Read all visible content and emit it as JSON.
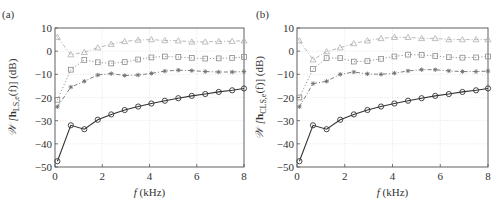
{
  "chart_data": [
    {
      "panel_label": "(a)",
      "type": "line",
      "title": "",
      "xlabel": "f (kHz)",
      "ylabel": "W [h_LS,e(f)] (dB)",
      "ylabel_parts": {
        "main": "𝒲 [",
        "bold": "h",
        "sub": "LS,e",
        "tail": "(f)] (dB)"
      },
      "xlim": [
        0,
        8
      ],
      "ylim": [
        -50,
        10
      ],
      "xticks": [
        0,
        2,
        4,
        6,
        8
      ],
      "yticks": [
        10,
        0,
        -10,
        -20,
        -30,
        -40,
        -50
      ],
      "grid": true,
      "legend": null,
      "x": [
        0.1,
        0.67,
        1.24,
        1.81,
        2.38,
        2.95,
        3.52,
        4.08,
        4.65,
        5.22,
        5.79,
        6.36,
        6.93,
        7.5,
        8.0
      ],
      "series": [
        {
          "name": "triangle",
          "marker": "triangle",
          "linestyle": "dashdot",
          "color": "#b0b0b0",
          "values": [
            6,
            -1.5,
            -0.5,
            1.5,
            3,
            4.2,
            4.8,
            5,
            4.6,
            4.5,
            4,
            4,
            4.2,
            4.3,
            4.5
          ]
        },
        {
          "name": "square",
          "marker": "square",
          "linestyle": "dotted",
          "color": "#8a8a8a",
          "values": [
            -21,
            -8,
            -3.8,
            -4.8,
            -5.3,
            -4.7,
            -3.6,
            -2.7,
            -2.3,
            -2.5,
            -2.9,
            -3.2,
            -3.1,
            -2.9,
            -2.5
          ]
        },
        {
          "name": "star",
          "marker": "star",
          "linestyle": "dashdot",
          "color": "#707070",
          "values": [
            -24,
            -15.5,
            -13,
            -10.3,
            -9.7,
            -10.5,
            -10.3,
            -9.6,
            -8.6,
            -8.2,
            -8.4,
            -8.8,
            -9,
            -9,
            -8.8
          ]
        },
        {
          "name": "circle",
          "marker": "circle",
          "linestyle": "solid",
          "color": "#333333",
          "values": [
            -47.5,
            -32,
            -33.7,
            -29.6,
            -27.3,
            -25.4,
            -23.9,
            -22.6,
            -21.4,
            -20.3,
            -19.3,
            -18.5,
            -17.6,
            -16.9,
            -16.1
          ]
        }
      ]
    },
    {
      "panel_label": "(b)",
      "type": "line",
      "title": "",
      "xlabel": "f (kHz)",
      "ylabel": "W [h_CLS,e(f)] (dB)",
      "ylabel_parts": {
        "main": "𝒲 [",
        "bold": "h",
        "sub": "CLS,e",
        "tail": "(f)] (dB)"
      },
      "xlim": [
        0,
        8
      ],
      "ylim": [
        -50,
        10
      ],
      "xticks": [
        0,
        2,
        4,
        6,
        8
      ],
      "yticks": [
        10,
        0,
        -10,
        -20,
        -30,
        -40,
        -50
      ],
      "grid": true,
      "legend": null,
      "x": [
        0.1,
        0.67,
        1.24,
        1.81,
        2.38,
        2.95,
        3.52,
        4.08,
        4.65,
        5.22,
        5.79,
        6.36,
        6.93,
        7.5,
        8.0
      ],
      "series": [
        {
          "name": "triangle",
          "marker": "triangle",
          "linestyle": "dashdot",
          "color": "#b0b0b0",
          "values": [
            4.5,
            -3.7,
            -0.2,
            1.5,
            3.3,
            4.5,
            5.5,
            6,
            6,
            5.5,
            5.5,
            5,
            5,
            5,
            5
          ]
        },
        {
          "name": "square",
          "marker": "square",
          "linestyle": "dotted",
          "color": "#8a8a8a",
          "values": [
            -20,
            -7.7,
            -3,
            -3,
            -4.5,
            -4.3,
            -3.3,
            -2.3,
            -1.5,
            -1.6,
            -2.1,
            -2.6,
            -2.8,
            -2.7,
            -2.3
          ]
        },
        {
          "name": "star",
          "marker": "star",
          "linestyle": "dashdot",
          "color": "#707070",
          "values": [
            -24,
            -14,
            -13,
            -10,
            -9,
            -9.8,
            -10,
            -9.5,
            -8.5,
            -8,
            -8,
            -8.5,
            -8.8,
            -8.8,
            -8.6
          ]
        },
        {
          "name": "circle",
          "marker": "circle",
          "linestyle": "solid",
          "color": "#333333",
          "values": [
            -47.5,
            -32,
            -33.7,
            -29.6,
            -27.3,
            -25.4,
            -23.9,
            -22.6,
            -21.4,
            -20.3,
            -19.3,
            -18.5,
            -17.6,
            -16.9,
            -16.1
          ]
        }
      ]
    }
  ],
  "layout": {
    "panels": [
      {
        "left": 55,
        "top": 28,
        "right": 244,
        "bottom": 167,
        "label_x": 2,
        "label_y": 18,
        "ylabel_x": 16
      },
      {
        "left": 297,
        "top": 28,
        "right": 488,
        "bottom": 167,
        "label_x": 256,
        "label_y": 18,
        "ylabel_x": 263
      }
    ],
    "axis_color": "#555555",
    "grid_color": "#d8d8d8"
  }
}
